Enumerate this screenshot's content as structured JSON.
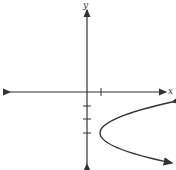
{
  "figure": {
    "x_axis_label": "x",
    "y_axis_label": "y",
    "curve": "parabola opening right",
    "vertex": [
      1,
      -3
    ],
    "x_ticks": [
      1
    ],
    "y_ticks": [
      -1,
      -2,
      -3
    ],
    "stroke_color": "#333333"
  }
}
